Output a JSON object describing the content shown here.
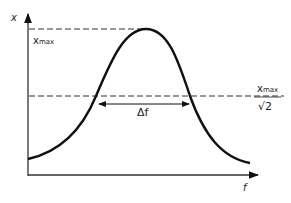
{
  "diagram": {
    "y_axis_label": "x",
    "x_axis_label": "f",
    "peak_label_main": "x",
    "peak_label_sub": "max",
    "halfpower_label_num_main": "x",
    "halfpower_label_num_sub": "max",
    "halfpower_label_den": "√2",
    "bandwidth_label": "Δf",
    "colors": {
      "line": "#111111",
      "dashed": "#333333",
      "background": "#ffffff"
    }
  }
}
